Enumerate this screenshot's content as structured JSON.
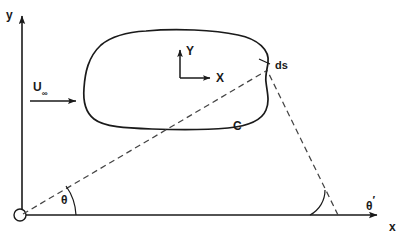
{
  "figure": {
    "type": "technical-line-diagram",
    "width": 404,
    "height": 239,
    "background_color": "#ffffff",
    "line_color": "#1a1a1a",
    "dashed_color": "#555555"
  },
  "global_axes": {
    "y_label": "y",
    "x_label": "x",
    "origin_marker": "open-circle"
  },
  "body_axes": {
    "y_label": "Y",
    "x_label": "X"
  },
  "freestream": {
    "label_main": "U",
    "label_subscript": "∞"
  },
  "curve": {
    "label": "C"
  },
  "element": {
    "label": "ds"
  },
  "angles": {
    "theta": "θ",
    "theta_prime_main": "θ",
    "theta_prime_mark": "′"
  },
  "geometry": {
    "global_origin": [
      20,
      215
    ],
    "y_axis_tip": [
      22,
      10
    ],
    "x_axis_tip": [
      385,
      215
    ],
    "body_axes_origin": [
      180,
      78
    ],
    "body_Y_tip": [
      180,
      46
    ],
    "body_X_tip": [
      215,
      78
    ],
    "ds_point": [
      266,
      71
    ],
    "theta_prime_vertex": [
      338,
      215
    ],
    "freestream_arrow": [
      30,
      101,
      82,
      101
    ]
  }
}
